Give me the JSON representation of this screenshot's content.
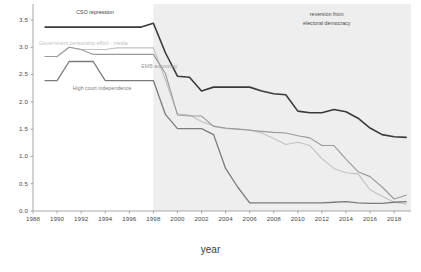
{
  "chart_data": {
    "type": "line",
    "title": "",
    "xlabel": "year",
    "ylabel": "",
    "xlim": [
      1988,
      2019.4
    ],
    "ylim": [
      0.0,
      3.72
    ],
    "grid": false,
    "legend_position": "inline-labels",
    "xticks": [
      1988,
      1990,
      1992,
      1994,
      1996,
      1998,
      2000,
      2002,
      2004,
      2006,
      2008,
      2010,
      2012,
      2014,
      2016,
      2018
    ],
    "yticks": [
      0.0,
      0.5,
      1.0,
      1.5,
      2.0,
      2.5,
      3.0,
      3.5
    ],
    "ytick_labels": [
      "0.0",
      "0.5",
      "1.0",
      "1.5",
      "2.0",
      "2.5",
      "3.0",
      "3.5"
    ],
    "x": [
      1989,
      1990,
      1991,
      1992,
      1993,
      1994,
      1995,
      1996,
      1997,
      1998,
      1999,
      2000,
      2001,
      2002,
      2003,
      2004,
      2005,
      2006,
      2007,
      2008,
      2009,
      2010,
      2011,
      2012,
      2013,
      2014,
      2015,
      2016,
      2017,
      2018,
      2019
    ],
    "series": [
      {
        "name": "CSO repression",
        "color": "#3a3a3a",
        "width": 1.6,
        "label_x": 1991.6,
        "label_y": 3.63,
        "values": [
          3.37,
          3.37,
          3.37,
          3.37,
          3.37,
          3.37,
          3.37,
          3.37,
          3.37,
          3.44,
          2.9,
          2.47,
          2.45,
          2.2,
          2.27,
          2.27,
          2.27,
          2.27,
          2.2,
          2.15,
          2.13,
          1.83,
          1.8,
          1.8,
          1.86,
          1.82,
          1.7,
          1.52,
          1.4,
          1.36,
          1.35
        ]
      },
      {
        "name": "Government censorship effort - media",
        "color": "#c2c2c2",
        "width": 1.1,
        "label_x": 1988.5,
        "label_y": 3.07,
        "values": [
          2.83,
          2.83,
          3.0,
          2.96,
          2.96,
          2.96,
          2.99,
          2.99,
          2.99,
          2.99,
          2.4,
          1.78,
          1.76,
          1.64,
          1.56,
          1.51,
          1.5,
          1.49,
          1.43,
          1.33,
          1.22,
          1.26,
          1.2,
          0.96,
          0.78,
          0.7,
          0.68,
          0.39,
          0.27,
          0.16,
          0.13
        ]
      },
      {
        "name": "EMB autonomy",
        "color": "#9a9a9a",
        "width": 1.1,
        "label_x": 1997.0,
        "label_y": 2.64,
        "values": [
          2.83,
          2.83,
          3.0,
          2.96,
          2.87,
          2.87,
          2.87,
          2.87,
          2.87,
          2.87,
          2.52,
          1.76,
          1.74,
          1.74,
          1.55,
          1.52,
          1.5,
          1.48,
          1.46,
          1.44,
          1.43,
          1.38,
          1.34,
          1.2,
          1.2,
          0.95,
          0.72,
          0.63,
          0.44,
          0.22,
          0.29
        ]
      },
      {
        "name": "High court independence",
        "color": "#7b7b7b",
        "width": 1.3,
        "label_x": 1991.3,
        "label_y": 2.24,
        "values": [
          2.39,
          2.39,
          2.74,
          2.74,
          2.74,
          2.39,
          2.39,
          2.39,
          2.39,
          2.39,
          1.77,
          1.51,
          1.51,
          1.51,
          1.4,
          0.78,
          0.44,
          0.15,
          0.15,
          0.15,
          0.15,
          0.15,
          0.15,
          0.15,
          0.16,
          0.17,
          0.15,
          0.14,
          0.14,
          0.16,
          0.17
        ]
      }
    ],
    "shaded_region": {
      "name": "reversion-band",
      "x_start": 1998,
      "x_end": 2019.4,
      "color": "#eeeeee",
      "annotation_line1": "reversion from",
      "annotation_line2": "electoral democracy",
      "annotation_x": 2012.4,
      "annotation_y": 3.62
    }
  }
}
